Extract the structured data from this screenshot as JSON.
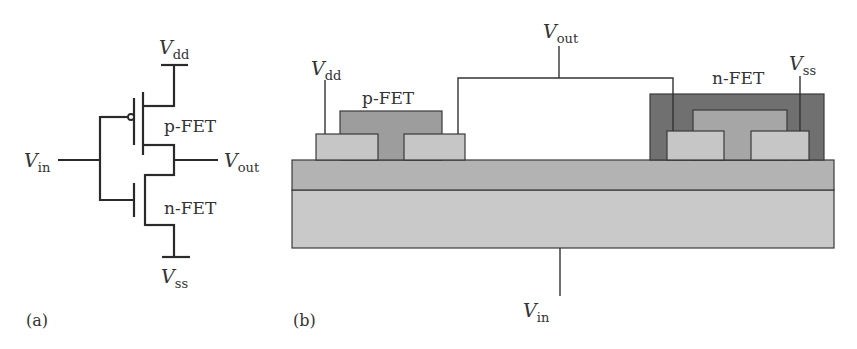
{
  "panel_a": {
    "tag": "(a)",
    "title": "CMOS inverter circuit schematic",
    "labels": {
      "vdd": {
        "main": "V",
        "sub": "dd"
      },
      "vss": {
        "main": "V",
        "sub": "ss"
      },
      "vin": {
        "main": "V",
        "sub": "in"
      },
      "vout": {
        "main": "V",
        "sub": "out"
      },
      "pfet": "p-FET",
      "nfet": "n-FET"
    }
  },
  "panel_b": {
    "tag": "(b)",
    "title": "CMOS inverter cross-section",
    "labels": {
      "vdd": {
        "main": "V",
        "sub": "dd"
      },
      "vss": {
        "main": "V",
        "sub": "ss"
      },
      "vin": {
        "main": "V",
        "sub": "in"
      },
      "vout": {
        "main": "V",
        "sub": "out"
      },
      "pfet": "p-FET",
      "nfet": "n-FET"
    },
    "colors": {
      "substrate": "#c9c9c9",
      "oxide_layer": "#b3b3b3",
      "source_drain": "#c6c6c6",
      "pfet_gate": "#9d9d9d",
      "nfet_well": "#707070",
      "nfet_gate": "#a6a6a6"
    }
  }
}
